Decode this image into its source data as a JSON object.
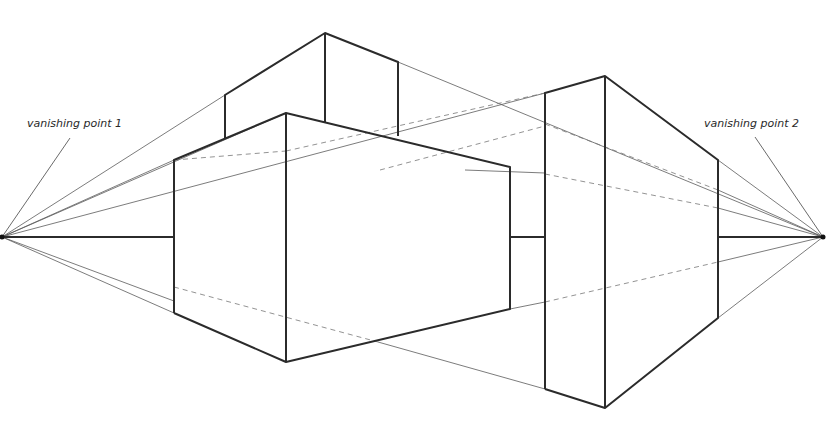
{
  "diagram": {
    "labels": {
      "vp1": "vanishing point 1",
      "vp2": "vanishing point 2"
    },
    "colors": {
      "background": "#ffffff",
      "heavy_line": "#2b2b2b",
      "construction_line": "#555555",
      "hidden_line": "#777777"
    },
    "vanishing_points": [
      {
        "id": "vp1",
        "x": 2,
        "y": 237
      },
      {
        "id": "vp2",
        "x": 823,
        "y": 237
      }
    ],
    "horizon_y": 237,
    "objects": [
      {
        "name": "left-box",
        "front_edge_x": 286,
        "left_edge_x": 174,
        "right_edge_x": 510
      },
      {
        "name": "top-box",
        "front_edge_x": 325,
        "left_edge_x": 225,
        "right_edge_x": 398
      },
      {
        "name": "tall-slab",
        "front_edge_x": 605,
        "left_edge_x": 545,
        "right_edge_x": 718
      }
    ]
  }
}
